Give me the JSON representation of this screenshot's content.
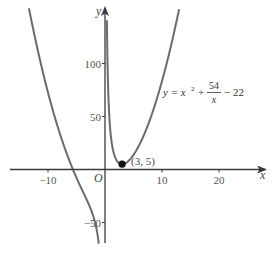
{
  "chart_data": {
    "type": "line",
    "title": "",
    "equation": {
      "lhs": "y = x",
      "sup": "2",
      "plus": "+",
      "num": "54",
      "den": "x",
      "tail": "− 22"
    },
    "series": [
      {
        "name": "y = x^2 + 54/x - 22",
        "branch": "x<0",
        "x": [
          -14.5,
          -13,
          -12,
          -10,
          -8,
          -6,
          -5,
          -4,
          -3,
          -2,
          -1.5,
          -1.2,
          -1.0,
          -0.85
        ],
        "y": [
          184.3,
          143.8,
          117.5,
          72.6,
          35.3,
          5.0,
          -7.8,
          -19.5,
          -31.0,
          -45.0,
          -55.8,
          -65.6,
          -75.0,
          -85.8
        ]
      },
      {
        "name": "y = x^2 + 54/x - 22",
        "branch": "x>0",
        "x": [
          0.38,
          0.45,
          0.6,
          0.8,
          1,
          1.5,
          2,
          2.5,
          3,
          4,
          5,
          6,
          7,
          8,
          9,
          10,
          11
        ],
        "y": [
          120.2,
          98.2,
          68.4,
          46.1,
          33.0,
          16.3,
          9.0,
          5.85,
          5.0,
          7.5,
          13.8,
          23.0,
          34.7,
          48.8,
          65.0,
          83.4,
          103.9
        ]
      }
    ],
    "points": [
      {
        "x": 3,
        "y": 5,
        "label": "(3, 5)"
      }
    ],
    "xlabel": "x",
    "ylabel": "y",
    "origin_label": "O",
    "x_ticks": [
      -10,
      10,
      20
    ],
    "x_tick_labels": [
      "−10",
      "10",
      "20"
    ],
    "y_ticks": [
      -50,
      50,
      100
    ],
    "y_tick_labels": [
      "−50",
      "50",
      "100"
    ],
    "xlim": [
      -17.5,
      28
    ],
    "ylim": [
      -85,
      150
    ],
    "grid": false,
    "colors": {
      "curve": "#6b6b6b",
      "axis": "#3a3a3a",
      "point": "#111111"
    }
  }
}
